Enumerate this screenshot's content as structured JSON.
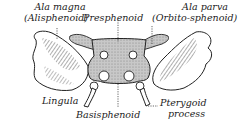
{
  "figure": {
    "colors": {
      "ink": "#222222",
      "body_fill": "#bdbdbd",
      "wing_fill": "#ffffff",
      "background": "#ffffff"
    }
  },
  "labels": {
    "ala_magna_line1": "Ala magna",
    "ala_magna_line2": "(Alisphenoid)",
    "presphenoid": "Presphenoid",
    "ala_parva_line1": "Ala parva",
    "ala_parva_line2": "(Orbito-sphenoid)",
    "lingula": "Lingula",
    "basisphenoid": "Basisphenoid",
    "pterygoid_line1": "Pterygoid",
    "pterygoid_line2": "process"
  }
}
